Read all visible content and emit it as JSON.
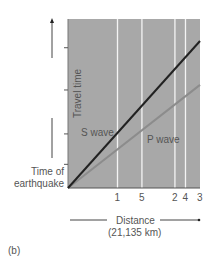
{
  "chart_data": {
    "type": "line",
    "title": "",
    "panel_label": "(b)",
    "xlabel": "Distance",
    "xlabel_sub": "(21,135 km)",
    "ylabel": "Travel time",
    "y_origin_label": "Time of earthquake",
    "grid": false,
    "background_color": "#a8a8a8",
    "x_ticks": [
      {
        "label": "1",
        "pos": 0.375
      },
      {
        "label": "5",
        "pos": 0.56
      },
      {
        "label": "2",
        "pos": 0.81
      },
      {
        "label": "4",
        "pos": 0.89
      },
      {
        "label": "3",
        "pos": 1.0
      }
    ],
    "y_ticks": [
      0.14,
      0.32,
      0.58,
      0.83
    ],
    "series": [
      {
        "name": "S wave",
        "color": "#222222",
        "x": [
          0,
          1
        ],
        "y": [
          0,
          0.87
        ]
      },
      {
        "name": "P wave",
        "color": "#8c8c8c",
        "x": [
          0,
          1
        ],
        "y": [
          0,
          0.61
        ]
      }
    ],
    "annotations": [
      {
        "text": "S wave",
        "x": 0.09,
        "y": 0.32
      },
      {
        "text": "P wave",
        "x": 0.6,
        "y": 0.26
      }
    ]
  }
}
